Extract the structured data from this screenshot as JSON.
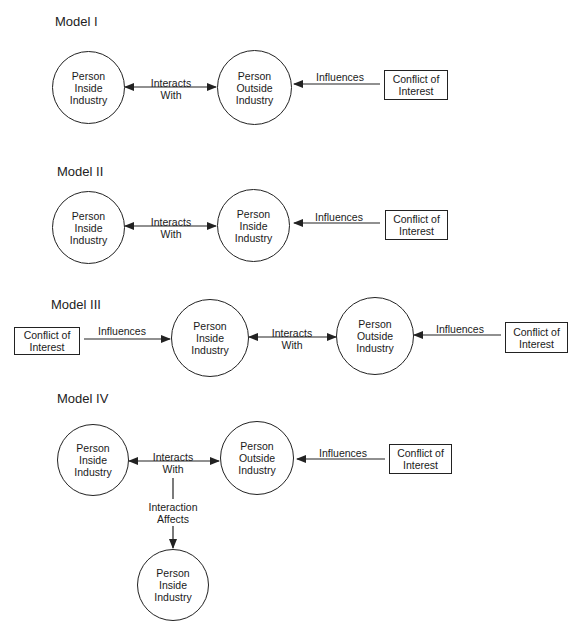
{
  "models": [
    {
      "title": "Model I",
      "left_node": "Person\nInside\nIndustry",
      "left_node_lines": [
        "Person",
        "Inside",
        "Industry"
      ],
      "right_node_lines": [
        "Person",
        "Outside",
        "Industry"
      ],
      "interaction_label_lines": [
        "Interacts",
        "With"
      ],
      "influence_label": "Influences",
      "source_box_lines": [
        "Conflict of",
        "Interest"
      ]
    },
    {
      "title": "Model II",
      "left_node_lines": [
        "Person",
        "Inside",
        "Industry"
      ],
      "right_node_lines": [
        "Person",
        "Inside",
        "Industry"
      ],
      "interaction_label_lines": [
        "Interacts",
        "With"
      ],
      "influence_label": "Influences",
      "source_box_lines": [
        "Conflict of",
        "Interest"
      ]
    },
    {
      "title": "Model III",
      "left_box_lines": [
        "Conflict of",
        "Interest"
      ],
      "left_influence_label": "Influences",
      "left_node_lines": [
        "Person",
        "Inside",
        "Industry"
      ],
      "right_node_lines": [
        "Person",
        "Outside",
        "Industry"
      ],
      "interaction_label_lines": [
        "Interacts",
        "With"
      ],
      "influence_label": "Influences",
      "source_box_lines": [
        "Conflict of",
        "Interest"
      ]
    },
    {
      "title": "Model IV",
      "left_node_lines": [
        "Person",
        "Inside",
        "Industry"
      ],
      "right_node_lines": [
        "Person",
        "Outside",
        "Industry"
      ],
      "interaction_label_lines": [
        "Interacts",
        "With"
      ],
      "influence_label": "Influences",
      "source_box_lines": [
        "Conflict of",
        "Interest"
      ],
      "effect_label_lines": [
        "Interaction",
        "Affects"
      ],
      "bottom_node_lines": [
        "Person",
        "Inside",
        "Industry"
      ]
    }
  ],
  "colors": {
    "line": "#222222",
    "background": "#ffffff"
  }
}
